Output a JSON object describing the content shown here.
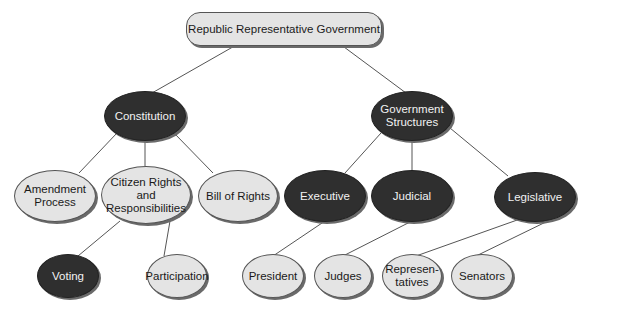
{
  "diagram": {
    "type": "concept-map",
    "root": "Republic Representative Government",
    "nodes": [
      {
        "id": "root",
        "label": "Republic Representative Government",
        "style": "light",
        "shape": "pill",
        "x": 186,
        "y": 12,
        "w": 196,
        "h": 34
      },
      {
        "id": "constitution",
        "label": "Constitution",
        "style": "dark",
        "shape": "ellipse",
        "x": 104,
        "y": 91,
        "w": 82,
        "h": 50
      },
      {
        "id": "govstructures",
        "label": "Government Structures",
        "style": "dark",
        "shape": "ellipse",
        "x": 371,
        "y": 91,
        "w": 82,
        "h": 50
      },
      {
        "id": "amendment",
        "label": "Amendment Process",
        "style": "light",
        "shape": "ellipse",
        "x": 14,
        "y": 170,
        "w": 82,
        "h": 52
      },
      {
        "id": "citizen",
        "label": "Citizen Rights and Responsibilities",
        "style": "light",
        "shape": "ellipse",
        "x": 101,
        "y": 166,
        "w": 90,
        "h": 58
      },
      {
        "id": "billofrights",
        "label": "Bill of Rights",
        "style": "light",
        "shape": "ellipse",
        "x": 198,
        "y": 170,
        "w": 80,
        "h": 52
      },
      {
        "id": "executive",
        "label": "Executive",
        "style": "dark",
        "shape": "ellipse",
        "x": 284,
        "y": 170,
        "w": 82,
        "h": 52
      },
      {
        "id": "judicial",
        "label": "Judicial",
        "style": "dark",
        "shape": "ellipse",
        "x": 371,
        "y": 170,
        "w": 82,
        "h": 52
      },
      {
        "id": "legislative",
        "label": "Legislative",
        "style": "dark",
        "shape": "ellipse",
        "x": 494,
        "y": 172,
        "w": 82,
        "h": 50
      },
      {
        "id": "voting",
        "label": "Voting",
        "style": "dark",
        "shape": "ellipse",
        "x": 37,
        "y": 254,
        "w": 62,
        "h": 44
      },
      {
        "id": "participation",
        "label": "Participation",
        "style": "light",
        "shape": "ellipse",
        "x": 147,
        "y": 254,
        "w": 60,
        "h": 44
      },
      {
        "id": "president",
        "label": "President",
        "style": "light",
        "shape": "ellipse",
        "x": 242,
        "y": 254,
        "w": 62,
        "h": 44
      },
      {
        "id": "judges",
        "label": "Judges",
        "style": "light",
        "shape": "ellipse",
        "x": 314,
        "y": 254,
        "w": 58,
        "h": 44
      },
      {
        "id": "representatives",
        "label": "Represen-\ntatives",
        "style": "light",
        "shape": "ellipse",
        "x": 382,
        "y": 254,
        "w": 60,
        "h": 44
      },
      {
        "id": "senators",
        "label": "Senators",
        "style": "light",
        "shape": "ellipse",
        "x": 451,
        "y": 254,
        "w": 62,
        "h": 44
      }
    ],
    "edges": [
      [
        "root",
        "constitution"
      ],
      [
        "root",
        "govstructures"
      ],
      [
        "constitution",
        "amendment"
      ],
      [
        "constitution",
        "citizen"
      ],
      [
        "constitution",
        "billofrights"
      ],
      [
        "citizen",
        "voting"
      ],
      [
        "citizen",
        "participation"
      ],
      [
        "govstructures",
        "executive"
      ],
      [
        "govstructures",
        "judicial"
      ],
      [
        "govstructures",
        "legislative"
      ],
      [
        "executive",
        "president"
      ],
      [
        "judicial",
        "judges"
      ],
      [
        "legislative",
        "representatives"
      ],
      [
        "legislative",
        "senators"
      ]
    ],
    "colors": {
      "light_fill": "#e4e4e4",
      "dark_fill": "#2f2f2f",
      "edge": "#555555"
    }
  }
}
